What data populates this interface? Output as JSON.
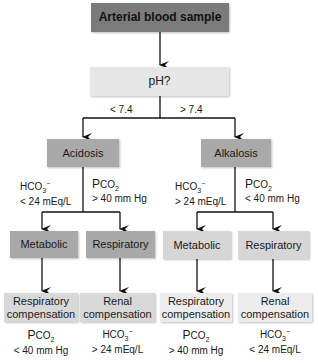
{
  "diagram": {
    "root": "Arterial blood sample",
    "question": "pH?",
    "branch_left_label": "< 7.4",
    "branch_right_label": "> 7.4",
    "acidosis": {
      "label": "Acidosis",
      "left_criterion": {
        "name": "HCO",
        "sub": "3",
        "sup": "−",
        "value": "< 24 mEq/L"
      },
      "right_criterion": {
        "name": "P",
        "sc": "CO",
        "sub": "2",
        "value": "> 40 mm Hg"
      },
      "metabolic": "Metabolic",
      "respiratory": "Respiratory",
      "comp_left_line1": "Respiratory",
      "comp_left_line2": "compensation",
      "comp_right_line1": "Renal",
      "comp_right_line2": "compensation",
      "comp_left_value": "< 40 mm Hg",
      "comp_right_value": "> 24 mEq/L"
    },
    "alkalosis": {
      "label": "Alkalosis",
      "left_criterion": {
        "name": "HCO",
        "sub": "3",
        "sup": "−",
        "value": "> 24 mEq/L"
      },
      "right_criterion": {
        "name": "P",
        "sc": "CO",
        "sub": "2",
        "value": "< 40 mm Hg"
      },
      "metabolic": "Metabolic",
      "respiratory": "Respiratory",
      "comp_left_line1": "Respiratory",
      "comp_left_line2": "compensation",
      "comp_right_line1": "Renal",
      "comp_right_line2": "compensation",
      "comp_left_value": "> 40 mm Hg",
      "comp_right_value": "< 24 mEq/L"
    }
  }
}
